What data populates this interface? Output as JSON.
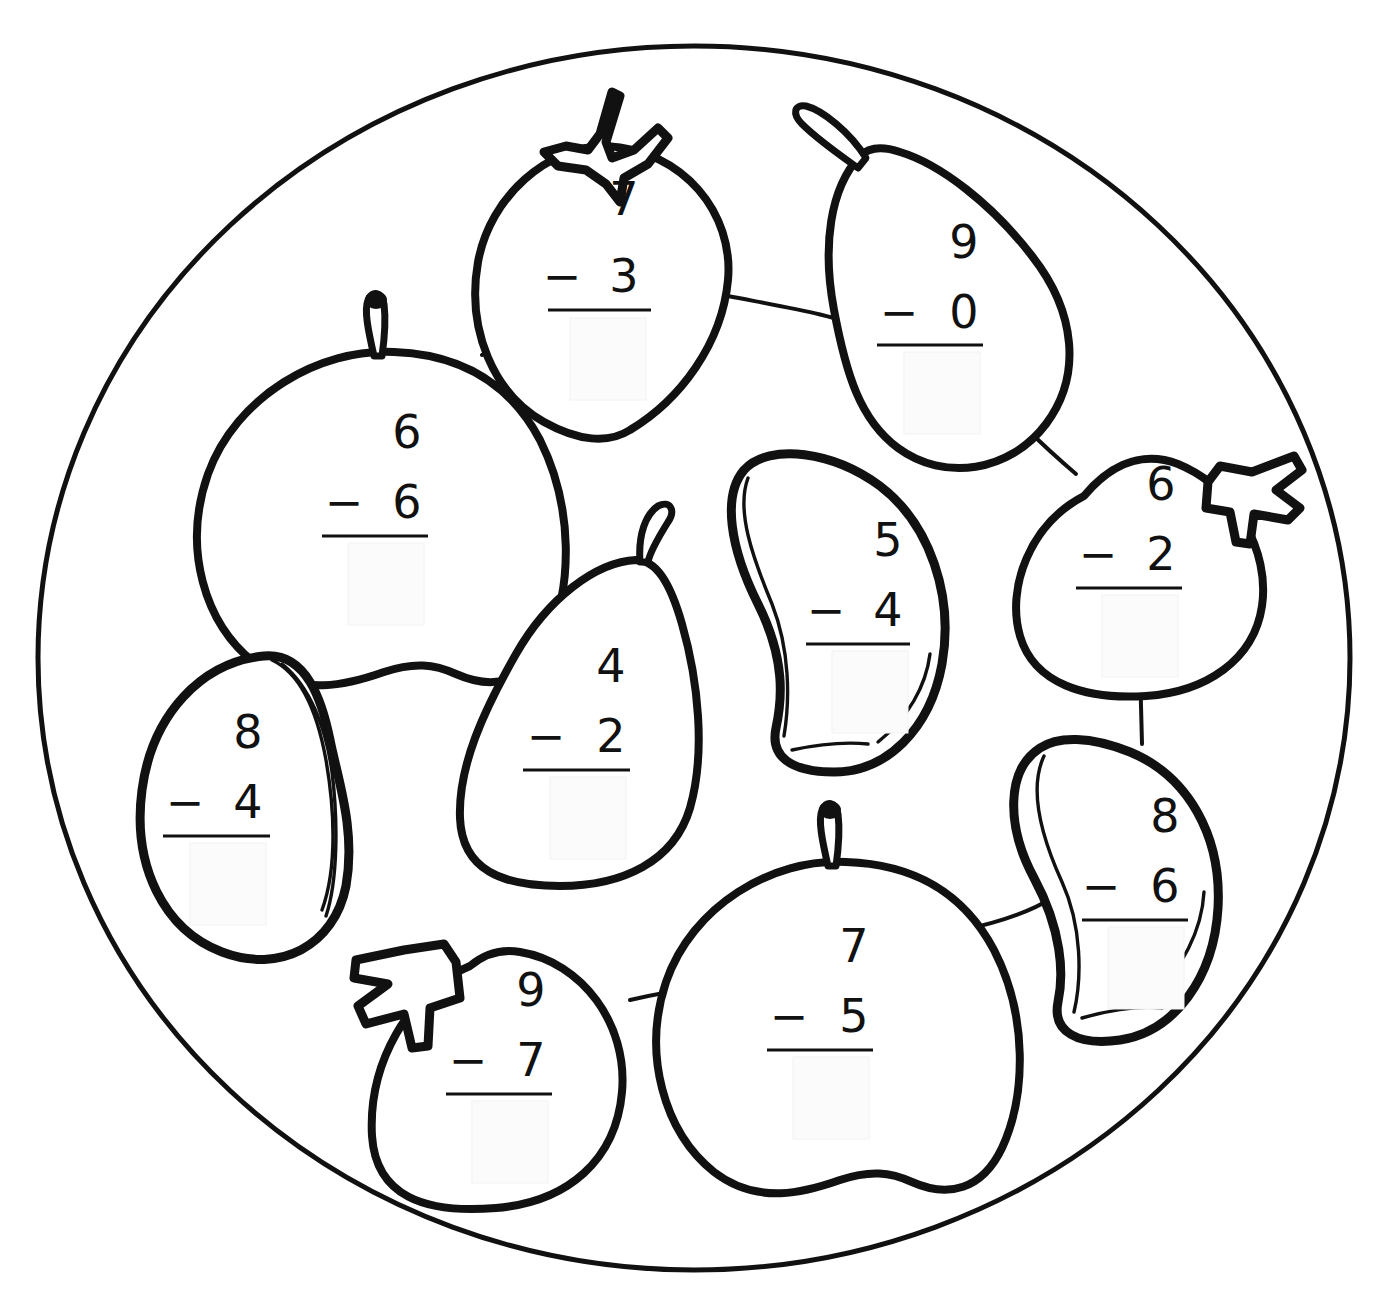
{
  "worksheet": {
    "title": "Fruit Plate Subtraction Coloring Worksheet",
    "shape_name": "plate",
    "background_color": "#ffffff",
    "line_color": "#111111",
    "answer_box_color": "#fbfbfb",
    "operator": "−"
  },
  "problems": [
    {
      "id": "strawberry-top",
      "fruit": "strawberry",
      "minuend": "7",
      "operator": "−",
      "subtrahend": "3",
      "answer": "",
      "cx": 604,
      "cy": 262
    },
    {
      "id": "pear-top-right",
      "fruit": "pear",
      "minuend": "9",
      "operator": "−",
      "subtrahend": "0",
      "answer": "",
      "cx": 950,
      "cy": 270
    },
    {
      "id": "apple-left",
      "fruit": "apple",
      "minuend": "6",
      "operator": "−",
      "subtrahend": "6",
      "answer": "",
      "cx": 389,
      "cy": 466
    },
    {
      "id": "strawberry-right",
      "fruit": "strawberry",
      "minuend": "6",
      "operator": "−",
      "subtrahend": "2",
      "answer": "",
      "cx": 1146,
      "cy": 524
    },
    {
      "id": "mango-center",
      "fruit": "mango",
      "minuend": "5",
      "operator": "−",
      "subtrahend": "4",
      "answer": "",
      "cx": 871,
      "cy": 578
    },
    {
      "id": "pear-center",
      "fruit": "pear",
      "minuend": "4",
      "operator": "−",
      "subtrahend": "2",
      "answer": "",
      "cx": 596,
      "cy": 700
    },
    {
      "id": "mango-left",
      "fruit": "mango",
      "minuend": "8",
      "operator": "−",
      "subtrahend": "4",
      "answer": "",
      "cx": 232,
      "cy": 770
    },
    {
      "id": "mango-right",
      "fruit": "mango",
      "minuend": "8",
      "operator": "−",
      "subtrahend": "6",
      "answer": "",
      "cx": 1152,
      "cy": 860
    },
    {
      "id": "apple-bottom",
      "fruit": "apple",
      "minuend": "7",
      "operator": "−",
      "subtrahend": "5",
      "answer": "",
      "cx": 838,
      "cy": 985
    },
    {
      "id": "strawberry-bottom",
      "fruit": "strawberry",
      "minuend": "9",
      "operator": "−",
      "subtrahend": "7",
      "answer": "",
      "cx": 515,
      "cy": 1028
    }
  ]
}
